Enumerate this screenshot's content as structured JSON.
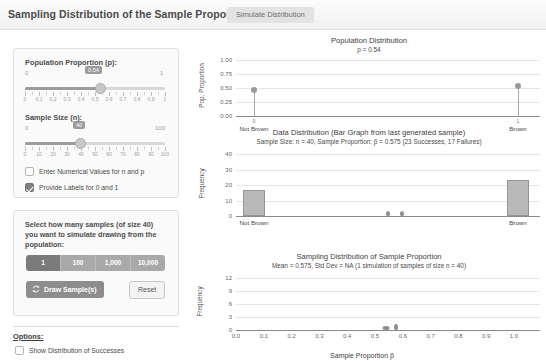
{
  "header": {
    "title": "Sampling Distribution of the Sample Proportion",
    "tab_label": "Simulate Distribution"
  },
  "controls": {
    "population_proportion": {
      "label": "Population Proportion (p):",
      "min": "0",
      "max": "1",
      "value": "0.54",
      "tick_labels": [
        "0",
        "0.1",
        "0.2",
        "0.3",
        "0.4",
        "0.5",
        "0.6",
        "0.7",
        "0.8",
        "0.9",
        "1"
      ]
    },
    "sample_size": {
      "label": "Sample Size (n):",
      "min": "0",
      "max": "100",
      "value": "40",
      "tick_labels": [
        "0",
        "10",
        "20",
        "30",
        "40",
        "50",
        "60",
        "70",
        "80",
        "90",
        "100"
      ]
    },
    "checkbox_numeric": {
      "label": "Enter Numerical Values for n and p",
      "checked": false
    },
    "checkbox_labels": {
      "label": "Provide Labels for 0 and 1",
      "checked": true
    }
  },
  "simulation": {
    "instructions": "Select how many samples (of size 40) you want to simulate drawing from the population:",
    "count_options": [
      "1",
      "100",
      "1,000",
      "10,000"
    ],
    "selected_count": "1",
    "draw_button": "Draw Sample(s)",
    "reset_button": "Reset",
    "refresh_icon": "refresh-icon"
  },
  "options": {
    "title": "Options:",
    "show_successes": {
      "label": "Show Distribution of Successes",
      "checked": false
    }
  },
  "chart_data": [
    {
      "id": "population-distribution",
      "type": "scatter",
      "title": "Population Distribution",
      "subtitle": "p = 0.54",
      "ylabel": "Pop. Proportion",
      "xlabel": "",
      "categories": [
        "Not Brown",
        "Brown"
      ],
      "category_codes": [
        "0",
        "1"
      ],
      "values": [
        0.46,
        0.54
      ],
      "yticks": [
        "0.00",
        "0.25",
        "0.50",
        "0.75",
        "1.00"
      ],
      "ylim": [
        0,
        1
      ],
      "grid": true
    },
    {
      "id": "data-distribution",
      "type": "bar",
      "title": "Data Distribution (Bar Graph from last generated sample)",
      "subtitle": "Sample Size: n = 40, Sample Proportion: p̂ = 0.575  (23 Successes, 17 Failures)",
      "ylabel": "Frequency",
      "xlabel": "",
      "categories": [
        "Not Brown",
        "Brown"
      ],
      "values": [
        17,
        23
      ],
      "yticks": [
        "0",
        "10",
        "20",
        "30",
        "40"
      ],
      "ylim": [
        0,
        40
      ],
      "grid": true
    },
    {
      "id": "sampling-distribution",
      "type": "histogram",
      "title": "Sampling Distribution of Sample Proportion",
      "subtitle": "Mean = 0.575, Std Dev = NA (1 simulation of samples of size n = 40)",
      "ylabel": "Frequency",
      "xlabel": "Sample Proportion p̂",
      "xticks": [
        "0.0",
        "0.1",
        "0.2",
        "0.3",
        "0.4",
        "0.5",
        "0.6",
        "0.7",
        "0.8",
        "0.9",
        "1.0"
      ],
      "yticks": [
        "0",
        "3",
        "6",
        "9",
        "12"
      ],
      "xlim": [
        0,
        1
      ],
      "ylim": [
        0,
        12
      ],
      "markers": [
        {
          "x": 0.54,
          "label": ""
        },
        {
          "x": 0.575,
          "label": ""
        }
      ],
      "grid": true
    }
  ],
  "colors": {
    "bar_fill": "#b9b9b9",
    "bar_stroke": "#949494",
    "point": "#9a9a9a",
    "grid": "#e6e6e6",
    "axis": "#8a8a8a",
    "accent": "#7b7b7b"
  }
}
